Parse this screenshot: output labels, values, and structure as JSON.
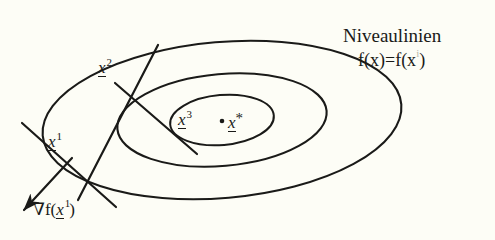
{
  "figure": {
    "title_caption": "Niveaulinien",
    "background_color": "#fdfdf6",
    "ink_color": "#1a1a18",
    "annotations": {
      "level_curves_label": "Niveaulinien",
      "level_curves_equation_prefix": "f(x)=f(x",
      "level_curves_equation_superscript": "i",
      "level_curves_equation_suffix": ")",
      "gradient_nabla": "∇",
      "gradient_fn_open": "f(",
      "gradient_var": "x",
      "gradient_sup": "1",
      "gradient_fn_close": ")"
    },
    "points": [
      {
        "id": "x1",
        "var": "x",
        "superscript": "1",
        "x": 58,
        "y": 148
      },
      {
        "id": "x2",
        "var": "x",
        "superscript": "2",
        "x": 113,
        "y": 78
      },
      {
        "id": "x3",
        "var": "x",
        "superscript": "3",
        "x": 188,
        "y": 128
      },
      {
        "id": "xstar",
        "var": "x",
        "superscript": "*",
        "x": 240,
        "y": 126
      }
    ],
    "center_dot": {
      "x": 222,
      "y": 121
    },
    "ellipses": [
      {
        "name": "outer-level-curve",
        "cx": 222,
        "cy": 120,
        "rx": 180,
        "ry": 78,
        "rotation": -5
      },
      {
        "name": "middle-level-curve",
        "cx": 222,
        "cy": 120,
        "rx": 105,
        "ry": 46,
        "rotation": -5
      },
      {
        "name": "inner-level-curve",
        "cx": 222,
        "cy": 120,
        "rx": 52,
        "ry": 25,
        "rotation": -5
      }
    ],
    "lines": [
      {
        "name": "tangent-at-x2",
        "x1": 158,
        "y1": 45,
        "x2": 78,
        "y2": 200
      },
      {
        "name": "search-direction-x2-to-x3",
        "x1": 115,
        "y1": 83,
        "x2": 196,
        "y2": 153
      },
      {
        "name": "tangent-at-x1",
        "x1": 22,
        "y1": 123,
        "x2": 115,
        "y2": 206
      },
      {
        "name": "gradient-arrow-x1",
        "x1": 70,
        "y1": 160,
        "x2": 22,
        "y2": 212
      }
    ]
  }
}
